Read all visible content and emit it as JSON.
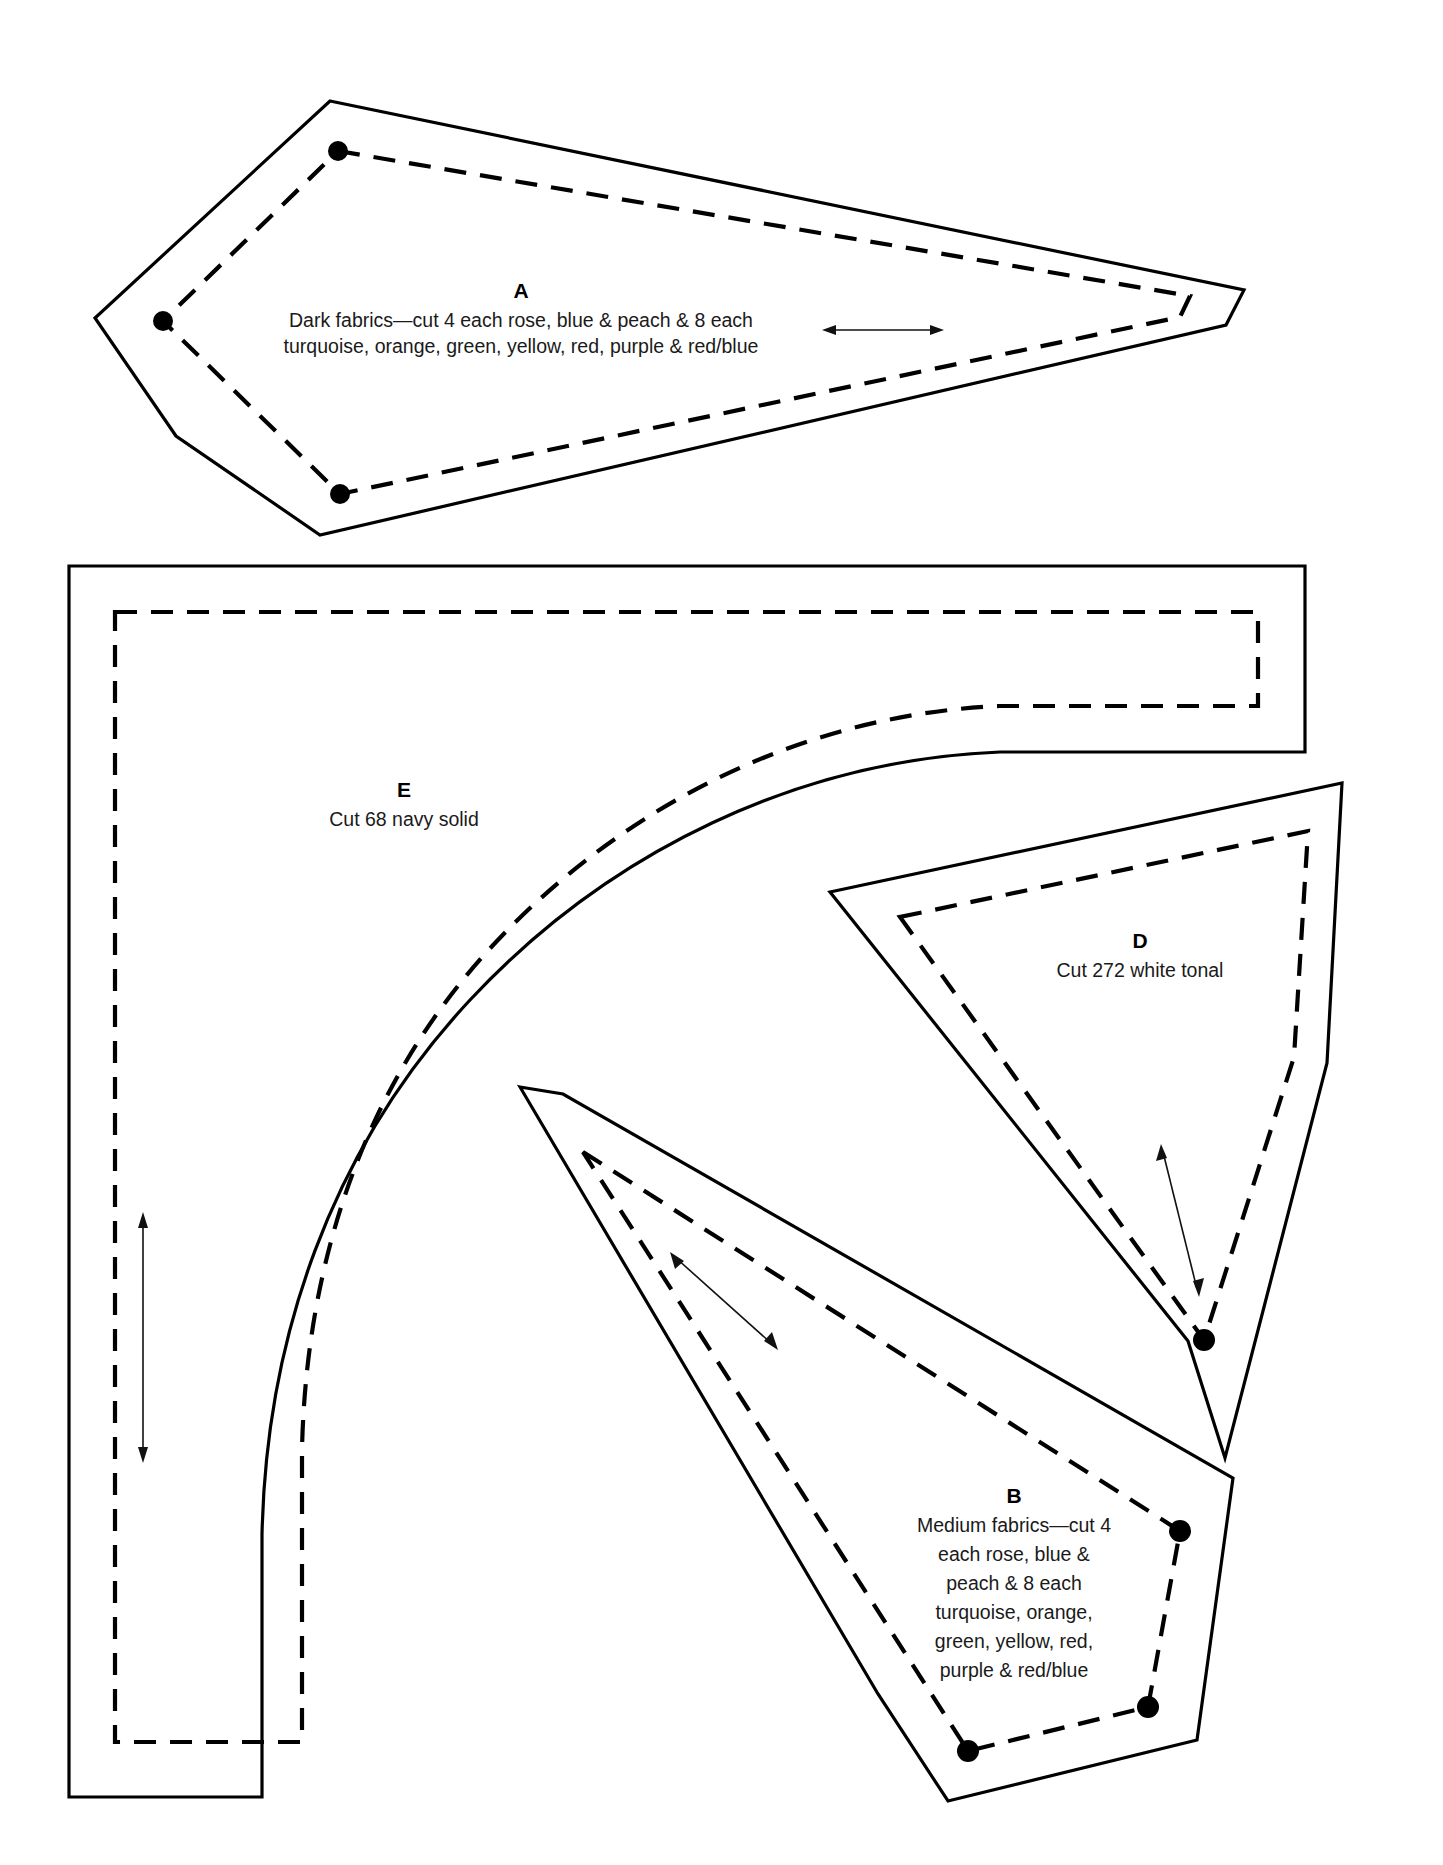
{
  "document": {
    "kind": "quilting-pattern-template-sheet",
    "background_color": "#ffffff",
    "line_color": "#000000",
    "width": 1443,
    "height": 1865
  },
  "pieces": {
    "a": {
      "letter": "A",
      "line1": "Dark fabrics—cut 4 each rose, blue & peach & 8 each",
      "line2": "turquoise, orange, green, yellow, red, purple & red/blue",
      "grain_arrow": "horizontal double-headed"
    },
    "e": {
      "letter": "E",
      "line1": "Cut 68 navy solid",
      "grain_arrow": "vertical double-headed"
    },
    "d": {
      "letter": "D",
      "line1": "Cut 272 white tonal",
      "grain_arrow": "double-headed diagonal"
    },
    "b": {
      "letter": "B",
      "line1": "Medium fabrics—cut 4",
      "line2": "each rose, blue &",
      "line3": "peach & 8 each",
      "line4": "turquoise, orange,",
      "line5": "green, yellow, red,",
      "line6": "purple & red/blue",
      "grain_arrow": "double-headed diagonal"
    }
  },
  "legend": {
    "cut_line_style": "solid",
    "seam_line_style": "dashed",
    "dot_marker": "seam intersection dot"
  }
}
